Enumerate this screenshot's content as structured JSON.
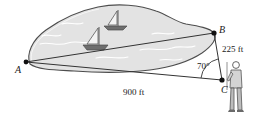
{
  "figure": {
    "name": "lake-survey-triangle-diagram",
    "vertices": {
      "a_label": "A",
      "b_label": "B",
      "c_label": "C"
    },
    "measurements": {
      "side_bc": "225 ft",
      "side_ac": "900 ft",
      "angle_c": "70°"
    },
    "scene": {
      "lake_fill": "#e3e3e3",
      "lake_stroke": "#4d4d4d",
      "line_color": "#333333",
      "boat_hull_color": "#6e6e6e",
      "sail_fill": "#f2f2f2",
      "person_fill": "#bfbfbf",
      "ripple_color": "#ffffff",
      "background": "#ffffff",
      "boat_count": 2,
      "person_count": 1
    }
  }
}
